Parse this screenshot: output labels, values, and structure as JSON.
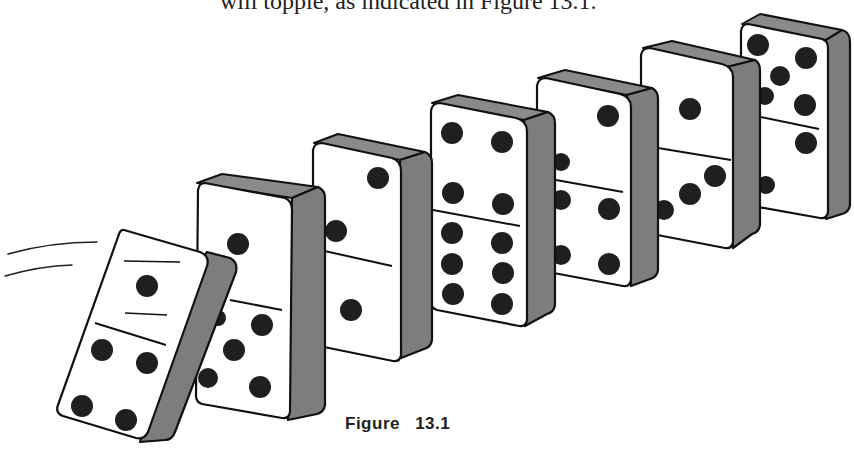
{
  "document": {
    "body_text_fragment": "will topple, as indicated in Figure 13.1.",
    "figure_caption": "Figure 13.1"
  },
  "figure": {
    "colors": {
      "face": "#ffffff",
      "side": "#7a7a7a",
      "pip": "#1e1e1e",
      "outline": "#111111"
    },
    "dominoes": [
      {
        "index": 1,
        "state": "falling",
        "top_pips": 1,
        "bottom_pips": 4
      },
      {
        "index": 2,
        "state": "standing",
        "top_pips": 1,
        "bottom_pips": 5
      },
      {
        "index": 3,
        "state": "standing",
        "top_pips": 2,
        "bottom_pips": 1
      },
      {
        "index": 4,
        "state": "standing",
        "top_pips": 4,
        "bottom_pips": 6
      },
      {
        "index": 5,
        "state": "standing",
        "top_pips": 2,
        "bottom_pips": 4
      },
      {
        "index": 6,
        "state": "standing",
        "top_pips": 1,
        "bottom_pips": 3
      },
      {
        "index": 7,
        "state": "standing",
        "top_pips": 5,
        "bottom_pips": 2
      }
    ],
    "motion_lines": 2
  }
}
